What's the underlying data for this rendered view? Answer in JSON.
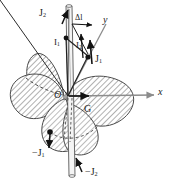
{
  "figure": {
    "axes": {
      "x_label": "x",
      "y_label": "y",
      "origin_label": "O",
      "centroid_label": "G"
    },
    "vector_labels": {
      "J2_top": "J",
      "J2_top_sub": "2",
      "J1_right": "J",
      "J1_right_sub": "1",
      "J1_neg": "−J",
      "J1_neg_sub": "1",
      "J2_neg": "−J",
      "J2_neg_sub": "2",
      "I1": "I",
      "I1_sub": "1",
      "I2": "I",
      "I2_sub": "2",
      "delta_l": "Δl"
    },
    "colors": {
      "ink": "#1a1a1a",
      "axis_gray": "#8c8c8c",
      "hatch_line": "#6f6f6f",
      "hatch_fill": "#ffffff",
      "rod_fill": "#f2f2f2",
      "rod_edge": "#6a6a6a",
      "node": "#121212",
      "dashed": "#4d4d4d"
    },
    "shapes": {
      "lobe_count": 4,
      "lobe_style": "diagonal-hatched",
      "rod_orientation": "vertical",
      "node_count": 3
    }
  }
}
